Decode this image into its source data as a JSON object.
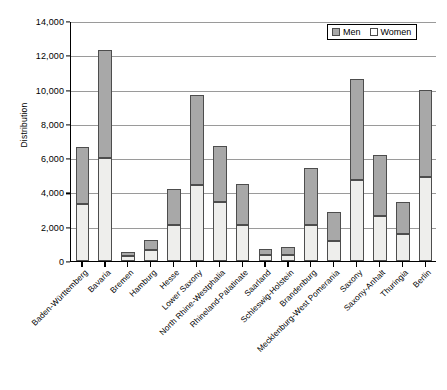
{
  "chart_data": {
    "type": "bar",
    "subtype": "stacked",
    "title": "",
    "xlabel": "",
    "ylabel": "Distribution",
    "ylim": [
      0,
      14000
    ],
    "ytick_step": 2000,
    "ytick_labels": [
      "0",
      "2,000",
      "4,000",
      "6,000",
      "8,000",
      "10,000",
      "12,000",
      "14,000"
    ],
    "ytick_values": [
      0,
      2000,
      4000,
      6000,
      8000,
      10000,
      12000,
      14000
    ],
    "grid": true,
    "grid_axis": "y",
    "legend_position": "top-right",
    "categories": [
      "Baden-Württemberg",
      "Bavaria",
      "Bremen",
      "Hamburg",
      "Hesse",
      "Lower Saxony",
      "North Rhine-Westphalia",
      "Rhineland-Palatinate",
      "Saarland",
      "Schleswig-Holstein",
      "Brandenburg",
      "Mecklenburg-West Pomerania",
      "Saxony",
      "Saxony-Anhalt",
      "Thuringia",
      "Berlin"
    ],
    "series": [
      {
        "name": "Women",
        "color": "#eeeeec",
        "values": [
          3300,
          6000,
          300,
          650,
          2100,
          4450,
          3450,
          2100,
          350,
          350,
          2100,
          1150,
          4700,
          2650,
          1550,
          4900
        ]
      },
      {
        "name": "Men",
        "color": "#a8a8a8",
        "values": [
          3350,
          6300,
          200,
          600,
          2100,
          5250,
          3250,
          2400,
          350,
          450,
          3300,
          1700,
          5900,
          3550,
          1900,
          5100
        ]
      }
    ],
    "totals": [
      6650,
      12300,
      500,
      1250,
      4200,
      9700,
      6700,
      4500,
      700,
      800,
      5400,
      2850,
      10600,
      6200,
      3450,
      10000
    ]
  },
  "legend": {
    "items": [
      {
        "label": "Men",
        "swatch": "men-swatch"
      },
      {
        "label": "Women",
        "swatch": "women-swatch"
      }
    ]
  }
}
